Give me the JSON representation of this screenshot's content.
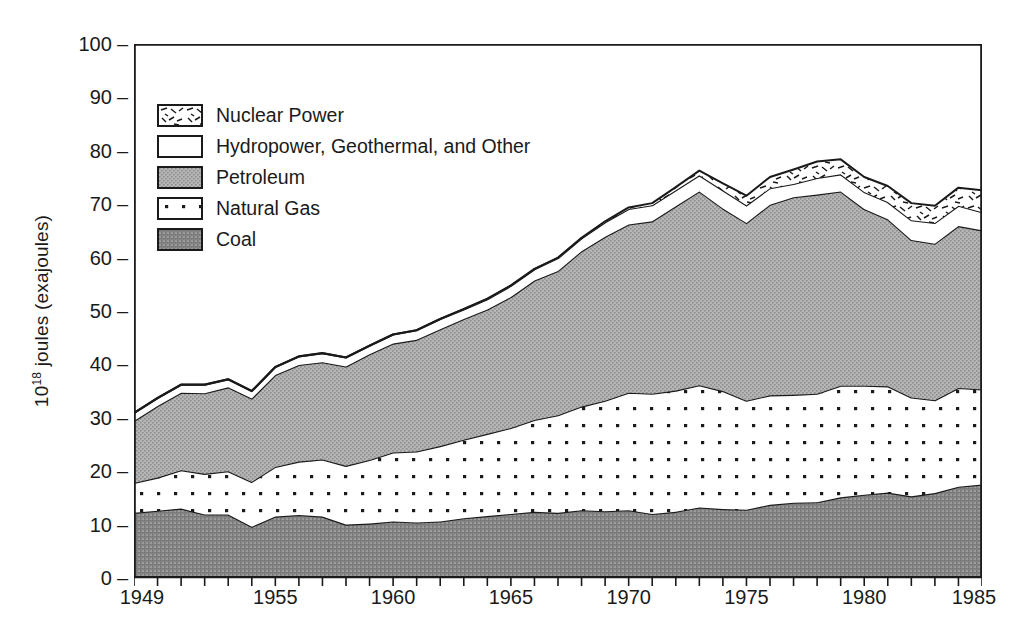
{
  "chart_data": {
    "type": "area",
    "title": "",
    "xlabel": "",
    "ylabel": "10^18 joules (exajoules)",
    "ylabel_mantissa": "10",
    "ylabel_exponent": "18",
    "ylabel_rest": " joules (exajoules)",
    "xlim": [
      1949,
      1985
    ],
    "ylim": [
      0,
      100
    ],
    "grid": false,
    "stacked": true,
    "legend_position": "upper-left-inside",
    "ytick_labels": [
      "100",
      "90",
      "80",
      "70",
      "60",
      "50",
      "40",
      "30",
      "20",
      "10",
      "0"
    ],
    "ytick_values": [
      100,
      90,
      80,
      70,
      60,
      50,
      40,
      30,
      20,
      10,
      0
    ],
    "xtick_labels": [
      "1949",
      "1955",
      "1960",
      "1965",
      "1970",
      "1975",
      "1980",
      "1985"
    ],
    "xtick_values": [
      1949,
      1955,
      1960,
      1965,
      1970,
      1975,
      1980,
      1985
    ],
    "x": [
      1949,
      1950,
      1951,
      1952,
      1953,
      1954,
      1955,
      1956,
      1957,
      1958,
      1959,
      1960,
      1961,
      1962,
      1963,
      1964,
      1965,
      1966,
      1967,
      1968,
      1969,
      1970,
      1971,
      1972,
      1973,
      1974,
      1975,
      1976,
      1977,
      1978,
      1979,
      1980,
      1981,
      1982,
      1983,
      1984,
      1985
    ],
    "series": [
      {
        "name": "Coal",
        "key": "coal",
        "fill": "#8f8f8f",
        "pattern": "solid-dark-gray",
        "values": [
          12.2,
          12.6,
          13.0,
          11.9,
          11.9,
          9.6,
          11.5,
          11.8,
          11.5,
          10.0,
          10.2,
          10.6,
          10.4,
          10.6,
          11.2,
          11.6,
          12.0,
          12.4,
          12.2,
          12.7,
          12.5,
          12.7,
          12.0,
          12.4,
          13.2,
          12.9,
          12.8,
          13.7,
          14.1,
          14.2,
          15.1,
          15.6,
          16.0,
          15.3,
          15.9,
          17.1,
          17.5
        ]
      },
      {
        "name": "Natural Gas",
        "key": "natural_gas",
        "fill": "#ffffff",
        "pattern": "dotted",
        "values": [
          5.6,
          6.2,
          7.2,
          7.6,
          8.1,
          8.4,
          9.3,
          10.0,
          10.7,
          11.0,
          11.9,
          12.9,
          13.3,
          14.1,
          14.7,
          15.4,
          16.1,
          17.2,
          18.3,
          19.4,
          20.7,
          22.0,
          22.5,
          22.7,
          22.9,
          22.1,
          20.4,
          20.5,
          20.2,
          20.3,
          20.9,
          20.4,
          19.9,
          18.5,
          17.4,
          18.5,
          17.8
        ]
      },
      {
        "name": "Petroleum",
        "key": "petroleum",
        "fill": "#aaaaaa",
        "pattern": "solid-gray",
        "values": [
          11.6,
          13.4,
          14.5,
          15.1,
          15.7,
          15.6,
          17.2,
          18.1,
          18.2,
          18.6,
          19.8,
          20.4,
          20.9,
          21.9,
          22.6,
          23.3,
          24.5,
          26.1,
          27.0,
          29.1,
          30.7,
          31.5,
          32.3,
          34.5,
          36.3,
          34.2,
          33.3,
          35.7,
          37.0,
          37.3,
          36.4,
          33.1,
          31.3,
          29.5,
          29.3,
          30.3,
          29.8
        ]
      },
      {
        "name": "Hydropower, Geothermal, and Other",
        "key": "hydro",
        "fill": "#ffffff",
        "pattern": "blank",
        "values": [
          1.5,
          1.5,
          1.5,
          1.6,
          1.5,
          1.4,
          1.5,
          1.6,
          1.7,
          1.7,
          1.6,
          1.7,
          1.8,
          1.9,
          1.8,
          1.9,
          2.1,
          2.1,
          2.4,
          2.4,
          2.7,
          2.9,
          3.0,
          3.0,
          3.0,
          3.4,
          3.3,
          3.1,
          2.5,
          3.1,
          3.2,
          3.2,
          3.2,
          3.7,
          3.9,
          3.8,
          3.4
        ]
      },
      {
        "name": "Nuclear Power",
        "key": "nuclear",
        "fill": "#ffffff",
        "pattern": "hatched-dashes",
        "values": [
          0,
          0,
          0,
          0,
          0,
          0,
          0,
          0,
          0,
          0,
          0,
          0,
          0,
          0,
          0.1,
          0.1,
          0.1,
          0.1,
          0.1,
          0.1,
          0.2,
          0.3,
          0.4,
          0.6,
          0.9,
          1.3,
          1.8,
          2.1,
          2.7,
          3.1,
          2.8,
          2.8,
          3.0,
          3.2,
          3.2,
          3.4,
          4.1
        ]
      }
    ]
  },
  "legend": {
    "items": [
      {
        "label": "Nuclear Power",
        "key": "nuclear"
      },
      {
        "label": "Hydropower, Geothermal, and Other",
        "key": "hydro"
      },
      {
        "label": "Petroleum",
        "key": "petroleum"
      },
      {
        "label": "Natural Gas",
        "key": "natural_gas"
      },
      {
        "label": "Coal",
        "key": "coal"
      }
    ]
  },
  "colors": {
    "ink": "#1a1a1a",
    "coal": "#8f8f8f",
    "petroleum": "#aaaaaa",
    "background": "#ffffff"
  }
}
